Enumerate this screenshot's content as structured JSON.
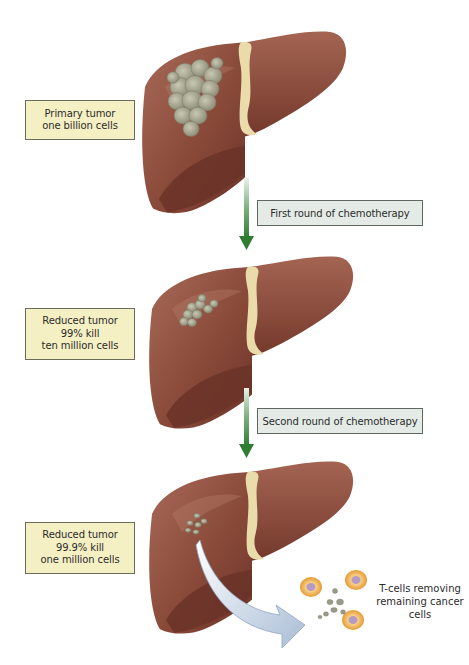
{
  "stages": [
    {
      "id": "primary",
      "label_lines": [
        "Primary tumor",
        "one billion cells"
      ]
    },
    {
      "id": "reduced-99",
      "label_lines": [
        "Reduced tumor",
        "99% kill",
        "ten million cells"
      ]
    },
    {
      "id": "reduced-999",
      "label_lines": [
        "Reduced tumor",
        "99.9% kill",
        "one million cells"
      ]
    }
  ],
  "steps": [
    {
      "label": "First round of chemotherapy"
    },
    {
      "label": "Second round of chemotherapy"
    }
  ],
  "tcells": {
    "caption_lines": [
      "T-cells removing",
      "remaining cancer cells"
    ]
  },
  "colors": {
    "liver": "#8a4a3a",
    "liver_dark": "#6b3328",
    "liver_light": "#a86a58",
    "ligament": "#eadcaa",
    "tumor": "#a8a890",
    "label_bg": "#f5f0c4",
    "chemo_bg": "#e4ebe6",
    "arrow_green": "#2e7d32",
    "tcell": "#f2b75a",
    "curve_arrow": "#b9c9dc"
  }
}
